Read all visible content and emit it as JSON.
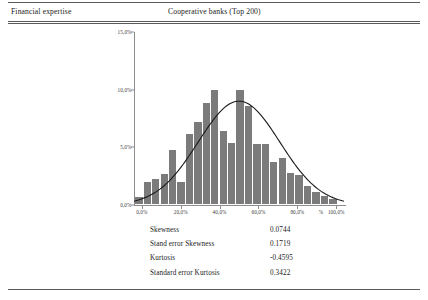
{
  "header": {
    "left_title": "Financial expertise",
    "center_title": "Cooperative banks (Top 200)"
  },
  "chart_data": {
    "type": "bar",
    "title": "",
    "xlabel": "%",
    "ylabel": "",
    "grid": false,
    "legend": false,
    "ylim": [
      0,
      15
    ],
    "xlim": [
      -4,
      104
    ],
    "y_ticks": [
      "0,0%",
      "5,0%",
      "10,0%",
      "15,0%"
    ],
    "y_tick_values": [
      0,
      5,
      10,
      15
    ],
    "x_ticks": [
      "0,0%",
      "20,0%",
      "40,0%",
      "60,0%",
      "80,0%",
      "100,0%"
    ],
    "x_tick_values": [
      0,
      20,
      40,
      60,
      80,
      100
    ],
    "x_axis_unit": "%",
    "bar_color": "#7b7b7b",
    "categories": [
      0,
      4.3,
      8.7,
      13,
      17.4,
      21.7,
      26.1,
      30.4,
      34.8,
      39.1,
      43.5,
      47.8,
      52.2,
      56.5,
      60.9,
      65.2,
      69.6,
      73.9,
      78.3,
      82.6,
      87,
      91.3,
      95.7,
      100
    ],
    "values": [
      0.6,
      1.9,
      2.2,
      2.6,
      4.7,
      1.9,
      6.1,
      7.1,
      8.8,
      9.9,
      6.3,
      5.3,
      9.9,
      8.5,
      5.2,
      5.2,
      3.6,
      4.0,
      2.7,
      2.5,
      1.6,
      1.0,
      0.7,
      0.4
    ],
    "overlay": {
      "type": "line",
      "name": "normal curve",
      "color": "#1a1a1a",
      "mean": 50,
      "peak_value": 9.0
    }
  },
  "stats": {
    "rows": [
      {
        "label": "Skewness",
        "value": "0.0744"
      },
      {
        "label": "Stand error Skewness",
        "value": "0.1719"
      },
      {
        "label": "Kurtosis",
        "value": "-0.4595"
      },
      {
        "label": "Standard error Kurtosis",
        "value": "0.3422"
      }
    ]
  }
}
